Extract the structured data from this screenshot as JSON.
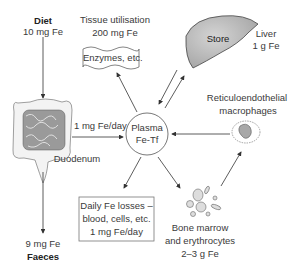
{
  "diet": {
    "title": "Diet",
    "amount": "10 mg Fe"
  },
  "tissue": {
    "title": "Tissue utilisation",
    "amount": "200 mg Fe",
    "box": "Enzymes, etc."
  },
  "liver": {
    "store": "Store",
    "title": "Liver",
    "amount": "1 g Fe"
  },
  "plasma": {
    "line1": "Plasma",
    "line2": "Fe-Tf"
  },
  "absorption": {
    "label": "1 mg Fe/day"
  },
  "duodenum": {
    "label": "Duodenum"
  },
  "re": {
    "line1": "Reticuloendothelial",
    "line2": "macrophages"
  },
  "losses": {
    "line1": "Daily Fe losses –",
    "line2": "blood, cells, etc.",
    "line3": "1 mg Fe/day"
  },
  "marrow": {
    "line1": "Bone marrow",
    "line2": "and erythrocytes",
    "line3": "2–3 g Fe"
  },
  "faeces": {
    "amount": "9 mg Fe",
    "title": "Faeces"
  },
  "colors": {
    "line": "#333333",
    "organ_fill": "#b8b8b8",
    "box_border": "#666666"
  }
}
